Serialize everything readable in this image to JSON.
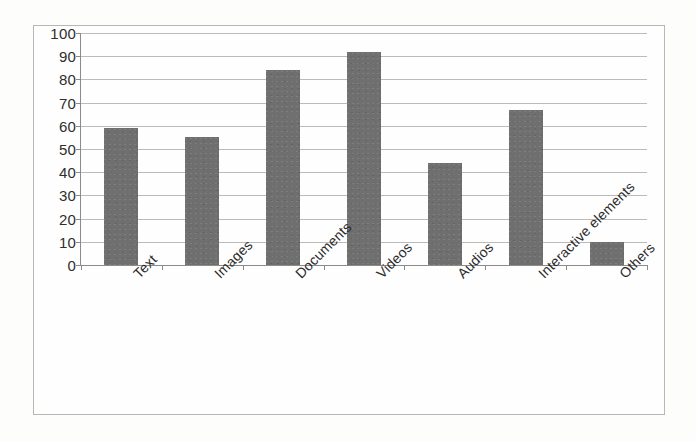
{
  "chart_data": {
    "type": "bar",
    "title": "",
    "subtitle": "",
    "xlabel": "",
    "ylabel": "",
    "categories": [
      "Text",
      "Images",
      "Documents",
      "Videos",
      "Audios",
      "Interactive elements",
      "Others"
    ],
    "values": [
      59,
      55,
      84,
      92,
      44,
      67,
      10
    ],
    "series": [
      {
        "name": "Series 1",
        "values": [
          59,
          55,
          84,
          92,
          44,
          67,
          10
        ]
      }
    ],
    "ylim": [
      0,
      100
    ],
    "y_ticks": [
      0,
      10,
      20,
      30,
      40,
      50,
      60,
      70,
      80,
      90,
      100
    ],
    "y_tick_labels": [
      "0",
      "10",
      "20",
      "30",
      "40",
      "50",
      "60",
      "70",
      "80",
      "90",
      "100"
    ],
    "grid": true,
    "grid_axis": "y",
    "legend": false,
    "legend_position": "none",
    "bar_color": "#6f6f6f",
    "gridline_color": "#bdbbb8",
    "axis_color": "#8d8b88",
    "frame_color": "#b9b7b4",
    "plot_background": "#fefefe",
    "label_rotation_deg": -45
  }
}
